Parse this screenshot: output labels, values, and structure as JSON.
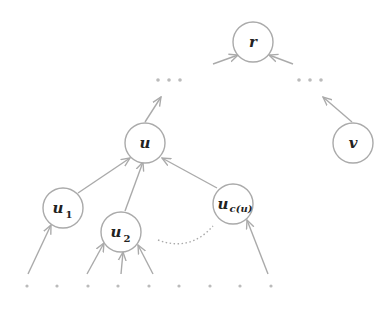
{
  "diagram": {
    "type": "tree",
    "colors": {
      "stroke": "#aaaaaa",
      "text": "#222222",
      "dots": "#bbbbbb",
      "background": "#ffffff"
    },
    "nodes": [
      {
        "id": "r",
        "label": "r",
        "sub": ""
      },
      {
        "id": "u",
        "label": "u",
        "sub": ""
      },
      {
        "id": "v",
        "label": "v",
        "sub": ""
      },
      {
        "id": "u1",
        "label": "u",
        "sub": "1"
      },
      {
        "id": "u2",
        "label": "u",
        "sub": "2"
      },
      {
        "id": "uc",
        "label": "u",
        "sub": "c(u)"
      }
    ],
    "edges": [
      {
        "from": "ellipsis-left",
        "to": "r"
      },
      {
        "from": "ellipsis-right",
        "to": "r"
      },
      {
        "from": "u",
        "to": "ellipsis-left"
      },
      {
        "from": "v",
        "to": "ellipsis-right"
      },
      {
        "from": "u1",
        "to": "u"
      },
      {
        "from": "u2",
        "to": "u"
      },
      {
        "from": "uc",
        "to": "u"
      },
      {
        "from": "leaf",
        "to": "u1"
      },
      {
        "from": "leaf",
        "to": "u2"
      },
      {
        "from": "leaf",
        "to": "u2"
      },
      {
        "from": "leaf",
        "to": "u2"
      },
      {
        "from": "leaf",
        "to": "uc"
      }
    ],
    "ellipses": [
      "left-ellipsis",
      "right-ellipsis"
    ],
    "leaf_dot_count": 9
  }
}
